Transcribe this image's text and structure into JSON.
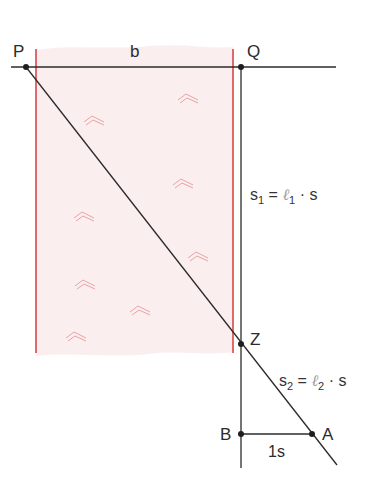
{
  "diagram": {
    "points": {
      "P": {
        "label": "P",
        "x": 26,
        "y": 67
      },
      "Q": {
        "label": "Q",
        "x": 241,
        "y": 67
      },
      "Z": {
        "label": "Z",
        "x": 241,
        "y": 344
      },
      "B": {
        "label": "B",
        "x": 241,
        "y": 434
      },
      "A": {
        "label": "A",
        "x": 312,
        "y": 434
      }
    },
    "labels": {
      "width": "b",
      "unit_segment": "1s"
    },
    "equations": {
      "s1": {
        "lhs": "s",
        "lhs_sub": "1",
        "eq": "=",
        "ell": "ℓ",
        "ell_sub": "1",
        "op": "·",
        "rhs": "s"
      },
      "s2": {
        "lhs": "s",
        "lhs_sub": "2",
        "eq": "=",
        "ell": "ℓ",
        "ell_sub": "2",
        "op": "·",
        "rhs": "s"
      }
    },
    "colors": {
      "river_fill": "#fbeeee",
      "river_bank": "#d9464a",
      "wave": "#e9a3a3",
      "line": "#2b2b2b",
      "point": "#1e1e1e"
    }
  }
}
